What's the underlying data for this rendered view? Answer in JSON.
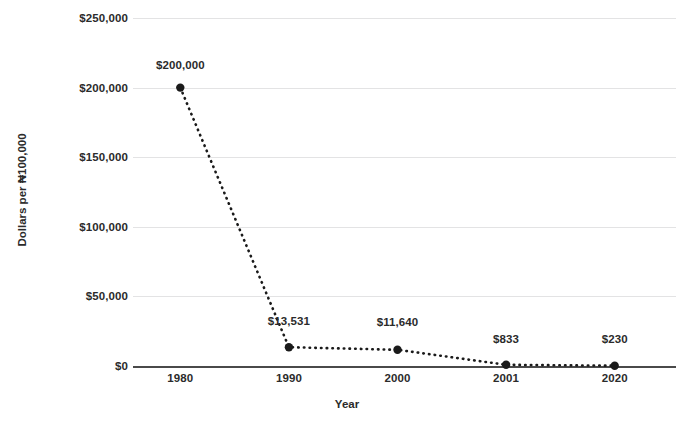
{
  "chart_data": {
    "type": "line",
    "title": "",
    "xlabel": "Year",
    "ylabel": "Dollars per ₦100,000",
    "categories": [
      "1980",
      "1990",
      "2000",
      "2001",
      "2020"
    ],
    "values": [
      200000,
      13531,
      11640,
      833,
      230
    ],
    "point_labels": [
      "$200,000",
      "$13,531",
      "$11,640",
      "$833",
      "$230"
    ],
    "ylim": [
      0,
      250000
    ],
    "yticks": [
      250000,
      200000,
      150000,
      100000,
      50000,
      0
    ],
    "ytick_labels": [
      "$250,000",
      "$200,000",
      "$150,000",
      "$100,000",
      "$50,000",
      "$0"
    ],
    "grid": true,
    "legend": "none",
    "series_style": "dotted",
    "marker": "circle",
    "colors": {
      "series": "#1a1a1a",
      "grid": "#e3e3e4",
      "axis": "#4a4a4a",
      "text": "#2b2b2b",
      "background": "#ffffff"
    }
  }
}
